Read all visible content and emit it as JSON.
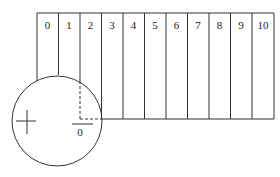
{
  "diagram": {
    "scale_labels": [
      "0",
      "1",
      "2",
      "3",
      "4",
      "5",
      "6",
      "7",
      "8",
      "9",
      "10"
    ],
    "zero_mark_label": "0",
    "line_color": "#333333",
    "background": "#ffffff"
  }
}
